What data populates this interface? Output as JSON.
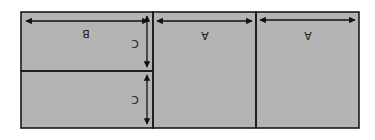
{
  "diagram": {
    "orientation": "rotated-180",
    "fill_color": "#b4b4b4",
    "line_color": "#1a1a1a",
    "panels": [
      {
        "id": "panel-left-top",
        "label": "B",
        "dims": [
          "B",
          "C"
        ]
      },
      {
        "id": "panel-left-bottom",
        "label": "C",
        "dims": [
          "C"
        ]
      },
      {
        "id": "panel-middle",
        "label": "A",
        "dims": [
          "A"
        ]
      },
      {
        "id": "panel-right",
        "label": "A",
        "dims": [
          "A"
        ]
      }
    ],
    "labels": {
      "b_width": "B",
      "c_height_top": "C",
      "c_height_bottom": "C",
      "a_width_middle": "A",
      "a_width_right": "A"
    }
  }
}
